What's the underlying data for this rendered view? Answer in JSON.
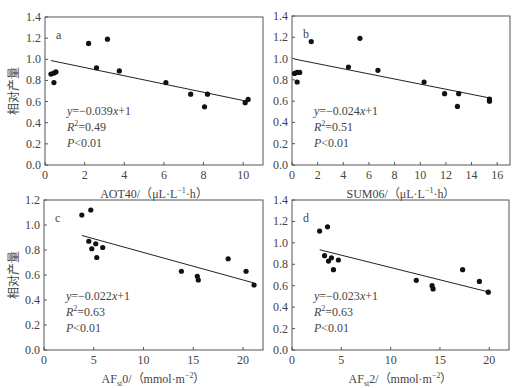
{
  "chart_data": [
    {
      "type": "scatter",
      "panel": "a",
      "xlabel": "AOT40/（μL·L⁻¹·h）",
      "ylabel": "相对产量",
      "xlim": [
        0,
        11
      ],
      "ylim": [
        0,
        1.4
      ],
      "xticks": [
        0,
        2,
        4,
        6,
        8,
        10
      ],
      "yticks": [
        0.0,
        0.2,
        0.4,
        0.6,
        0.8,
        1.0,
        1.2,
        1.4
      ],
      "x": [
        0.3,
        0.45,
        0.55,
        0.45,
        2.2,
        3.15,
        2.6,
        3.75,
        6.1,
        7.35,
        8.2,
        8.05,
        10.1,
        10.25
      ],
      "y": [
        0.86,
        0.87,
        0.88,
        0.78,
        1.15,
        1.19,
        0.92,
        0.89,
        0.78,
        0.67,
        0.67,
        0.55,
        0.59,
        0.62
      ],
      "fit": {
        "slope": -0.039,
        "intercept": 1,
        "x_range": [
          0.3,
          10.25
        ]
      },
      "annotations": {
        "equation": "y=−0.039x+1",
        "r2": "R²=0.49",
        "p": "P<0.01"
      }
    },
    {
      "type": "scatter",
      "panel": "b",
      "xlabel": "SUM06/（μL·L⁻¹·h）",
      "ylabel": "",
      "xlim": [
        0,
        17
      ],
      "ylim": [
        0,
        1.4
      ],
      "xticks": [
        0,
        2,
        4,
        6,
        8,
        10,
        12,
        14,
        16
      ],
      "yticks": [
        0.0,
        0.2,
        0.4,
        0.6,
        0.8,
        1.0,
        1.2,
        1.4
      ],
      "x": [
        0.2,
        0.4,
        0.6,
        0.4,
        1.5,
        5.3,
        4.4,
        6.7,
        10.3,
        11.9,
        13.0,
        12.9,
        15.4,
        15.4
      ],
      "y": [
        0.86,
        0.87,
        0.87,
        0.78,
        1.16,
        1.19,
        0.92,
        0.89,
        0.78,
        0.67,
        0.67,
        0.55,
        0.6,
        0.62
      ],
      "fit": {
        "slope": -0.024,
        "intercept": 1,
        "x_range": [
          0.2,
          15.4
        ]
      },
      "annotations": {
        "equation": "y=−0.024x+1",
        "r2": "R²=0.51",
        "p": "P<0.01"
      }
    },
    {
      "type": "scatter",
      "panel": "c",
      "xlabel": "AFst0/（mmol·m⁻²）",
      "ylabel": "相对产量",
      "xlim": [
        0,
        22
      ],
      "ylim": [
        0,
        1.2
      ],
      "xticks": [
        0,
        5,
        10,
        15,
        20
      ],
      "yticks": [
        0.0,
        0.2,
        0.4,
        0.6,
        0.8,
        1.0,
        1.2
      ],
      "x": [
        3.8,
        4.7,
        4.5,
        5.2,
        4.8,
        5.9,
        5.3,
        13.8,
        15.4,
        15.5,
        18.5,
        20.3,
        21.1
      ],
      "y": [
        1.08,
        1.12,
        0.87,
        0.85,
        0.81,
        0.82,
        0.74,
        0.63,
        0.59,
        0.56,
        0.73,
        0.63,
        0.52
      ],
      "fit": {
        "slope": -0.022,
        "intercept": 1,
        "x_range": [
          3.8,
          21.1
        ]
      },
      "annotations": {
        "equation": "y=−0.022x+1",
        "r2": "R²=0.63",
        "p": "P<0.01"
      }
    },
    {
      "type": "scatter",
      "panel": "d",
      "xlabel": "AFst2/（mmol·m⁻²）",
      "ylabel": "",
      "xlim": [
        0,
        22
      ],
      "ylim": [
        0,
        1.4
      ],
      "xticks": [
        0,
        5,
        10,
        15,
        20
      ],
      "yticks": [
        0.0,
        0.2,
        0.4,
        0.6,
        0.8,
        1.0,
        1.2,
        1.4
      ],
      "x": [
        2.8,
        3.6,
        3.3,
        3.7,
        4.0,
        4.2,
        4.7,
        12.6,
        14.2,
        14.3,
        17.3,
        19.0,
        19.9
      ],
      "y": [
        1.11,
        1.15,
        0.88,
        0.83,
        0.86,
        0.75,
        0.84,
        0.65,
        0.6,
        0.57,
        0.75,
        0.64,
        0.54
      ],
      "fit": {
        "slope": -0.023,
        "intercept": 1,
        "x_range": [
          2.8,
          19.9
        ]
      },
      "annotations": {
        "equation": "y=−0.023x+1",
        "r2": "R²=0.63",
        "p": "P<0.01"
      }
    }
  ],
  "panels": [
    {
      "label": "a",
      "xlabel_main": "AOT40/",
      "xlabel_sub": "",
      "xlabel_unit": "（μL·L",
      "xlabel_sup": "−1",
      "xlabel_tail": "·h）",
      "ylabel": "相对产量",
      "eq_y": "y",
      "eq_rest": "=−0.039",
      "eq_x": "x",
      "eq_tail": "+1",
      "r2_r": "R",
      "r2_val": "=0.49",
      "p_p": "P",
      "p_val": "<0.01"
    },
    {
      "label": "b",
      "xlabel_main": "SUM06/",
      "xlabel_sub": "",
      "xlabel_unit": "（μL·L",
      "xlabel_sup": "−1",
      "xlabel_tail": "·h）",
      "ylabel": "",
      "eq_y": "y",
      "eq_rest": "=−0.024",
      "eq_x": "x",
      "eq_tail": "+1",
      "r2_r": "R",
      "r2_val": "=0.51",
      "p_p": "P",
      "p_val": "<0.01"
    },
    {
      "label": "c",
      "xlabel_main": "AF",
      "xlabel_sub": "st",
      "xlabel_unit": "0/（mmol·m",
      "xlabel_sup": "−2",
      "xlabel_tail": "）",
      "ylabel": "相对产量",
      "eq_y": "y",
      "eq_rest": "=−0.022",
      "eq_x": "x",
      "eq_tail": "+1",
      "r2_r": "R",
      "r2_val": "=0.63",
      "p_p": "P",
      "p_val": "<0.01"
    },
    {
      "label": "d",
      "xlabel_main": "AF",
      "xlabel_sub": "st",
      "xlabel_unit": "2/（mmol·m",
      "xlabel_sup": "−2",
      "xlabel_tail": "）",
      "ylabel": "",
      "eq_y": "y",
      "eq_rest": "=−0.023",
      "eq_x": "x",
      "eq_tail": "+1",
      "r2_r": "R",
      "r2_val": "=0.63",
      "p_p": "P",
      "p_val": "<0.01"
    }
  ],
  "r2_sup": "2",
  "colors": {
    "axis": "#555555",
    "point": "#111111",
    "fit": "#222222",
    "text": "#444444"
  }
}
